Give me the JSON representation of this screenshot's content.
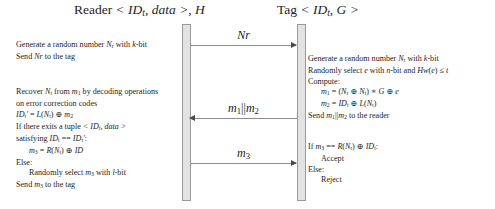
{
  "diagram": {
    "type": "protocol-sequence-diagram",
    "parties": [
      {
        "id": "reader",
        "header": "Reader < IDt, data >, H"
      },
      {
        "id": "tag",
        "header": "Tag < IDt, G >"
      }
    ],
    "messages": [
      {
        "id": "msg1",
        "label": "Nr",
        "direction": "reader-to-tag"
      },
      {
        "id": "msg2",
        "label": "m1||m2",
        "direction": "tag-to-reader"
      },
      {
        "id": "msg3",
        "label": "m3",
        "direction": "reader-to-tag"
      }
    ],
    "notes": {
      "reader_step_1": [
        "Generate a random number Nr with k-bit",
        "Send Nr to the tag"
      ],
      "tag_step_1": [
        "Generate a random number Nt with k-bit",
        "Randomly select e with n-bit and Hw(e) ≤ t",
        "Compute:",
        "m1 = (Nr ⊕ Nt) * G ⊕ e",
        "m2 = IDt ⊕ L(Nt)",
        "Send m1||m2 to the reader"
      ],
      "reader_step_2": [
        "Recover Nt from m1 by decoding operations",
        "on error correction codes",
        "IDt' = L(Nt) ⊕ m2",
        "If there exits a tuple < IDt, data >",
        "satisfying IDt == IDt':",
        "m3 = R(Nt) ⊕ ID",
        "Else:",
        "Randomly select m3 with l-bit",
        "Send m3 to the tag"
      ],
      "tag_step_2": [
        "If m3 == R(Nt) ⊕ IDt:",
        "Accept",
        "Else:",
        "Reject"
      ]
    },
    "colors": {
      "lifeline_fill": "#e2e2e2",
      "lifeline_border": "#9a9a9a",
      "arrow": "#8d8d8d",
      "text": "#1d1d1d",
      "background": "#ffffff"
    }
  }
}
